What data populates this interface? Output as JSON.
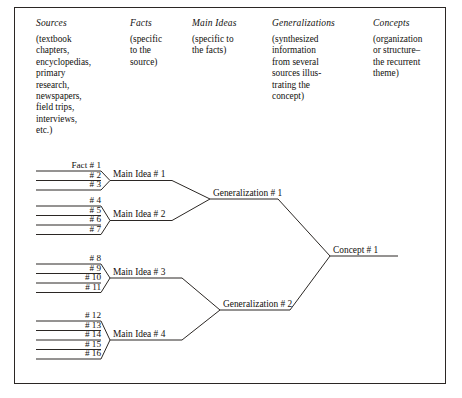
{
  "figure": {
    "frame": {
      "border_color": "#2b2724"
    },
    "line_color": "#2b2724"
  },
  "columns": [
    {
      "id": "sources",
      "title": "Sources",
      "description": "(textbook\nchapters,\nencyclopedias,\nprimary\nresearch,\nnewspapers,\nfield trips,\ninterviews,\netc.)"
    },
    {
      "id": "facts",
      "title": "Facts",
      "description": "(specific\nto the\nsource)"
    },
    {
      "id": "main_ideas",
      "title": "Main Ideas",
      "description": "(specific to\nthe facts)"
    },
    {
      "id": "generalizations",
      "title": "Generalizations",
      "description": "(synthesized\ninformation\nfrom several\nsources illus-\ntrating the\nconcept)"
    },
    {
      "id": "concepts",
      "title": "Concepts",
      "description": "(organization\nor structure–\nthe recurrent\ntheme)"
    }
  ],
  "diagram": {
    "fact_groups": [
      {
        "id": "group-1",
        "facts": [
          "Fact  # 1",
          "# 2",
          "# 3"
        ]
      },
      {
        "id": "group-2",
        "facts": [
          "# 4",
          "# 5",
          "# 6",
          "# 7"
        ]
      },
      {
        "id": "group-3",
        "facts": [
          "# 8",
          "# 9",
          "# 10",
          "# 11"
        ]
      },
      {
        "id": "group-4",
        "facts": [
          "# 12",
          "# 13",
          "# 14",
          "# 15",
          "# 16"
        ]
      }
    ],
    "main_ideas": [
      "Main Idea # 1",
      "Main Idea # 2",
      "Main Idea # 3",
      "Main Idea # 4"
    ],
    "generalizations": [
      "Generalization # 1",
      "Generalization # 2"
    ],
    "concepts": [
      "Concept # 1"
    ]
  }
}
